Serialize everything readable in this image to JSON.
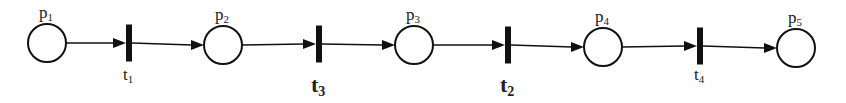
{
  "diagram": {
    "type": "petri-net",
    "colors": {
      "stroke": "#111111",
      "background": "#ffffff"
    },
    "places": [
      {
        "id": "p1",
        "base": "p",
        "sub": "1",
        "cx": 47,
        "cy": 43,
        "r": 19
      },
      {
        "id": "p2",
        "base": "p",
        "sub": "2",
        "cx": 223,
        "cy": 45,
        "r": 19
      },
      {
        "id": "p3",
        "base": "p",
        "sub": "3",
        "cx": 414,
        "cy": 45,
        "r": 19
      },
      {
        "id": "p4",
        "base": "p",
        "sub": "4",
        "cx": 603,
        "cy": 47,
        "r": 19
      },
      {
        "id": "p5",
        "base": "p",
        "sub": "5",
        "cx": 796,
        "cy": 48,
        "r": 19
      }
    ],
    "transitions": [
      {
        "id": "t1",
        "base": "t",
        "sub": "1",
        "x": 129,
        "cy": 43,
        "emphasis": false
      },
      {
        "id": "t3",
        "base": "t",
        "sub": "3",
        "x": 319,
        "cy": 44,
        "emphasis": true
      },
      {
        "id": "t2",
        "base": "t",
        "sub": "2",
        "x": 508,
        "cy": 45,
        "emphasis": true
      },
      {
        "id": "t4",
        "base": "t",
        "sub": "4",
        "x": 700,
        "cy": 46,
        "emphasis": false
      }
    ],
    "arcs": [
      {
        "from": "p1",
        "to": "t1"
      },
      {
        "from": "t1",
        "to": "p2"
      },
      {
        "from": "p2",
        "to": "t3"
      },
      {
        "from": "t3",
        "to": "p3"
      },
      {
        "from": "p3",
        "to": "t2"
      },
      {
        "from": "t2",
        "to": "p4"
      },
      {
        "from": "p4",
        "to": "t4"
      },
      {
        "from": "t4",
        "to": "p5"
      }
    ]
  }
}
